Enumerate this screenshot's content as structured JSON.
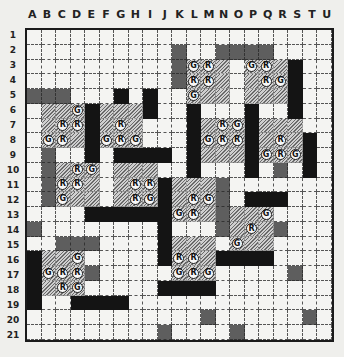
{
  "board": {
    "columns": [
      "A",
      "B",
      "C",
      "D",
      "E",
      "F",
      "G",
      "H",
      "I",
      "J",
      "K",
      "L",
      "M",
      "N",
      "O",
      "P",
      "Q",
      "R",
      "S",
      "T",
      "U"
    ],
    "rows": [
      "1",
      "2",
      "3",
      "4",
      "5",
      "6",
      "7",
      "8",
      "9",
      "10",
      "11",
      "12",
      "13",
      "14",
      "15",
      "16",
      "17",
      "18",
      "19",
      "20",
      "21"
    ],
    "legend": {
      ".": "empty",
      "B": "black",
      "S": "dark-stipple",
      "H": "hatched"
    },
    "cells": [
      ".....................",
      "..........S..SSSS....",
      "..........SHHH.HHHB..",
      "..........SHHH.HHHB..",
      "SSS...B.B..HHH.HHHB..",
      ".HHHBHHHB..B...B..B..",
      ".HHHBHHH...BHHHBHHH..",
      ".HHHBHHH...BHHHBHHHB.",
      ".S..B.BBBB.BHHHBHHHB.",
      ".SHHH.HHH..B...B.S.B.",
      ".SHHH.HHHBHHHS.......",
      ".SHHH.HHHBHHHS.BBB...",
      "....BBBBBBHHHSHHH....",
      "S........B...SHHHS...",
      "..SSS....BHHH.HHH....",
      "BHHH.....BHHHBBBB....",
      "BHHHS.....HHH.....S..",
      "BHHH.....BBBB........",
      "B..BBBB..............",
      "............S......S.",
      ".........S....S......"
    ],
    "markers": [
      {
        "cell": "L3",
        "label": "G"
      },
      {
        "cell": "M3",
        "label": "R"
      },
      {
        "cell": "P3",
        "label": "G"
      },
      {
        "cell": "Q3",
        "label": "R"
      },
      {
        "cell": "L4",
        "label": "R"
      },
      {
        "cell": "M4",
        "label": "R"
      },
      {
        "cell": "Q4",
        "label": "R"
      },
      {
        "cell": "R4",
        "label": "G"
      },
      {
        "cell": "L5",
        "label": "G"
      },
      {
        "cell": "D6",
        "label": "G"
      },
      {
        "cell": "C7",
        "label": "R"
      },
      {
        "cell": "D7",
        "label": "R"
      },
      {
        "cell": "G7",
        "label": "R"
      },
      {
        "cell": "N7",
        "label": "R"
      },
      {
        "cell": "O7",
        "label": "G"
      },
      {
        "cell": "B8",
        "label": "G"
      },
      {
        "cell": "C8",
        "label": "R"
      },
      {
        "cell": "F8",
        "label": "G"
      },
      {
        "cell": "G8",
        "label": "R"
      },
      {
        "cell": "H8",
        "label": "G"
      },
      {
        "cell": "M8",
        "label": "G"
      },
      {
        "cell": "N8",
        "label": "R"
      },
      {
        "cell": "O8",
        "label": "R"
      },
      {
        "cell": "R8",
        "label": "R"
      },
      {
        "cell": "Q9",
        "label": "G"
      },
      {
        "cell": "R9",
        "label": "R"
      },
      {
        "cell": "S9",
        "label": "G"
      },
      {
        "cell": "D10",
        "label": "R"
      },
      {
        "cell": "E10",
        "label": "G"
      },
      {
        "cell": "C11",
        "label": "R"
      },
      {
        "cell": "D11",
        "label": "R"
      },
      {
        "cell": "H11",
        "label": "R"
      },
      {
        "cell": "I11",
        "label": "R"
      },
      {
        "cell": "C12",
        "label": "G"
      },
      {
        "cell": "H12",
        "label": "R"
      },
      {
        "cell": "I12",
        "label": "G"
      },
      {
        "cell": "L12",
        "label": "R"
      },
      {
        "cell": "M12",
        "label": "G"
      },
      {
        "cell": "K13",
        "label": "G"
      },
      {
        "cell": "L13",
        "label": "R"
      },
      {
        "cell": "Q13",
        "label": "G"
      },
      {
        "cell": "P14",
        "label": "R"
      },
      {
        "cell": "O15",
        "label": "G"
      },
      {
        "cell": "D16",
        "label": "G"
      },
      {
        "cell": "K16",
        "label": "R"
      },
      {
        "cell": "L16",
        "label": "R"
      },
      {
        "cell": "B17",
        "label": "G"
      },
      {
        "cell": "C17",
        "label": "R"
      },
      {
        "cell": "D17",
        "label": "R"
      },
      {
        "cell": "K17",
        "label": "G"
      },
      {
        "cell": "L17",
        "label": "R"
      },
      {
        "cell": "M17",
        "label": "G"
      },
      {
        "cell": "C18",
        "label": "R"
      },
      {
        "cell": "D18",
        "label": "G"
      }
    ]
  }
}
